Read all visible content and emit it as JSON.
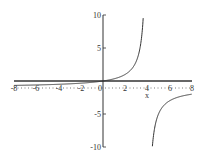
{
  "chart_data": {
    "type": "line",
    "title": "",
    "xlabel": "x",
    "ylabel": "",
    "xlim": [
      -8,
      8
    ],
    "ylim": [
      -10,
      10
    ],
    "grid": false,
    "legend": null,
    "x_ticks": [
      "-8",
      "-6",
      "-4",
      "-2",
      "0",
      "2",
      "4",
      "6",
      "8"
    ],
    "y_ticks": [
      "10",
      "5",
      "-5",
      "-10"
    ],
    "asymptotes": {
      "vertical": 4,
      "horizontal": 0
    },
    "series": [
      {
        "name": "f(x)",
        "x": [
          -8,
          -6,
          -4,
          -2,
          0,
          1,
          2,
          3,
          3.5,
          3.7,
          4.5,
          5,
          6,
          7,
          8
        ],
        "y": [
          -0.67,
          -0.6,
          -0.5,
          -0.33,
          0,
          0.33,
          1,
          3,
          7,
          10,
          -9,
          -5,
          -3,
          -2.33,
          -2
        ]
      }
    ]
  },
  "axis": {
    "x_label": "x",
    "x_tick_labels": [
      "-8",
      "-6",
      "-4",
      "-2",
      "0",
      "2",
      "4",
      "6",
      "8"
    ],
    "y_tick_labels": [
      "10",
      "5",
      "-5",
      "-10"
    ]
  }
}
